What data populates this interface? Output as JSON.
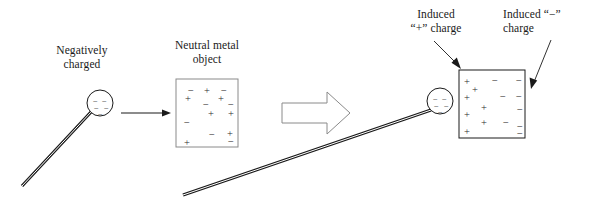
{
  "figure": {
    "background_color": "#ffffff",
    "line_color": "#1a1a1a",
    "charge_color": "#2b2b2b"
  },
  "labels": {
    "negatively_charged": "Negatively\ncharged",
    "neutral_metal_object": "Neutral metal\nobject",
    "induced_plus_charge": "Induced\n“+” charge",
    "induced_minus_charge": "Induced “−”\ncharge"
  },
  "icons": {
    "process_arrow": "block-right-arrow-icon",
    "transition_arrow": "right-arrow-icon",
    "pointer_plus": "annotation-arrow-icon",
    "pointer_minus": "annotation-arrow-icon",
    "charged_rod": "charged-rod-icon",
    "charged_sphere": "charged-sphere-icon"
  },
  "left_scene": {
    "name": "negatively charged rod with sphere",
    "sphere": {
      "cx": 100,
      "cy": 103,
      "r": 13,
      "charges": [
        {
          "sign": "−",
          "x": 93,
          "y": 97
        },
        {
          "sign": "−",
          "x": 102,
          "y": 97
        },
        {
          "sign": "−",
          "x": 94,
          "y": 104
        },
        {
          "sign": "−",
          "x": 104,
          "y": 104
        },
        {
          "sign": "−",
          "x": 98,
          "y": 110
        }
      ]
    },
    "rod": {
      "x1": 91,
      "y1": 112,
      "x2": 22,
      "y2": 186,
      "width": 3
    }
  },
  "neutral_box": {
    "name": "neutral metal object",
    "x": 176,
    "y": 79,
    "w": 62,
    "h": 68,
    "charges": [
      {
        "sign": "−",
        "x": 188,
        "y": 86
      },
      {
        "sign": "+",
        "x": 204,
        "y": 86
      },
      {
        "sign": "−",
        "x": 221,
        "y": 86
      },
      {
        "sign": "+",
        "x": 185,
        "y": 94
      },
      {
        "sign": "+",
        "x": 218,
        "y": 94
      },
      {
        "sign": "−",
        "x": 203,
        "y": 100
      },
      {
        "sign": "−",
        "x": 228,
        "y": 100
      },
      {
        "sign": "+",
        "x": 208,
        "y": 109
      },
      {
        "sign": "+",
        "x": 228,
        "y": 109
      },
      {
        "sign": "−",
        "x": 184,
        "y": 118
      },
      {
        "sign": "−",
        "x": 209,
        "y": 130
      },
      {
        "sign": "+",
        "x": 227,
        "y": 129
      },
      {
        "sign": "−",
        "x": 228,
        "y": 137
      },
      {
        "sign": "+",
        "x": 184,
        "y": 138
      }
    ]
  },
  "right_scene": {
    "name": "polarized metal object with charged rod",
    "sphere": {
      "cx": 440,
      "cy": 101,
      "r": 13,
      "charges": [
        {
          "sign": "−",
          "x": 433,
          "y": 95
        },
        {
          "sign": "−",
          "x": 442,
          "y": 95
        },
        {
          "sign": "−",
          "x": 434,
          "y": 102
        },
        {
          "sign": "−",
          "x": 444,
          "y": 102
        },
        {
          "sign": "−",
          "x": 438,
          "y": 108
        }
      ]
    },
    "rod": {
      "x1": 431,
      "y1": 110,
      "x2": 183,
      "y2": 195,
      "width": 3
    }
  },
  "induced_box": {
    "name": "polarized metal object",
    "x": 459,
    "y": 70,
    "w": 66,
    "h": 68,
    "charges": [
      {
        "sign": "+",
        "x": 464,
        "y": 77
      },
      {
        "sign": "−",
        "x": 492,
        "y": 76
      },
      {
        "sign": "−",
        "x": 516,
        "y": 76
      },
      {
        "sign": "+",
        "x": 472,
        "y": 85
      },
      {
        "sign": "+",
        "x": 464,
        "y": 93
      },
      {
        "sign": "−",
        "x": 500,
        "y": 92
      },
      {
        "sign": "−",
        "x": 516,
        "y": 92
      },
      {
        "sign": "+",
        "x": 481,
        "y": 103
      },
      {
        "sign": "−",
        "x": 517,
        "y": 105
      },
      {
        "sign": "+",
        "x": 464,
        "y": 110
      },
      {
        "sign": "+",
        "x": 481,
        "y": 118
      },
      {
        "sign": "−",
        "x": 503,
        "y": 118
      },
      {
        "sign": "−",
        "x": 517,
        "y": 122
      },
      {
        "sign": "+",
        "x": 464,
        "y": 127
      },
      {
        "sign": "−",
        "x": 517,
        "y": 129
      }
    ]
  },
  "annotations": {
    "plus_arrow": {
      "x1": 434,
      "y1": 41,
      "x2": 461,
      "y2": 68
    },
    "minus_arrow": {
      "x1": 551,
      "y1": 40,
      "x2": 531,
      "y2": 88
    },
    "transition_arrow": {
      "x1": 121,
      "y1": 113,
      "x2": 171,
      "y2": 113
    },
    "block_arrow": {
      "x": 282,
      "y": 92,
      "w": 68,
      "h": 42
    }
  }
}
